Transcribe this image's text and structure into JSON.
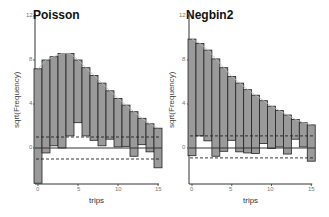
{
  "chart_data": [
    {
      "type": "bar",
      "subtype": "hanging rootogram",
      "title": "Poisson",
      "xlabel": "trips",
      "ylabel": "sqrt(Frequency)",
      "x": [
        0,
        1,
        2,
        3,
        4,
        5,
        6,
        7,
        8,
        9,
        10,
        11,
        12,
        13,
        14,
        15
      ],
      "bar_top": [
        7.2,
        8.0,
        8.3,
        8.6,
        8.6,
        8.0,
        7.3,
        6.6,
        5.9,
        5.2,
        4.5,
        3.9,
        3.3,
        2.7,
        2.2,
        1.8
      ],
      "bar_bottom": [
        -3.2,
        -0.45,
        0.2,
        0.0,
        1.1,
        2.3,
        1.1,
        0.7,
        0.2,
        0.8,
        0.1,
        0.15,
        -0.75,
        0.3,
        -0.35,
        -1.8
      ],
      "reference_lines": {
        "zero": 0,
        "upper_dashed": 1.0,
        "lower_dashed": -1.0
      },
      "xticks": [
        0,
        5,
        10,
        15
      ],
      "yticks": [
        0,
        4,
        8,
        12
      ],
      "xlim": [
        0,
        15
      ],
      "ylim": [
        -3.5,
        12
      ],
      "grid": false
    },
    {
      "type": "bar",
      "subtype": "hanging rootogram",
      "title": "Negbin2",
      "xlabel": "trips",
      "ylabel": "sqrt(Frequency)",
      "x": [
        0,
        1,
        2,
        3,
        4,
        5,
        6,
        7,
        8,
        9,
        10,
        11,
        12,
        13,
        14,
        15
      ],
      "bar_top": [
        9.9,
        9.5,
        8.9,
        8.1,
        7.3,
        6.5,
        5.9,
        5.3,
        4.8,
        4.3,
        3.8,
        3.4,
        3.0,
        2.6,
        2.3,
        2.1
      ],
      "bar_bottom": [
        -0.7,
        1.1,
        0.65,
        -0.75,
        -0.3,
        0.7,
        -0.35,
        -0.45,
        -0.5,
        0.4,
        -0.05,
        0.1,
        -0.55,
        0.8,
        0.1,
        -1.2
      ],
      "reference_lines": {
        "zero": 0,
        "upper_dashed": 1.1,
        "lower_dashed": -0.9
      },
      "xticks": [
        0,
        5,
        10,
        15
      ],
      "yticks": [
        0,
        4,
        8,
        12
      ],
      "xlim": [
        0,
        15
      ],
      "ylim": [
        -3.5,
        12
      ],
      "grid": false
    }
  ],
  "panels": [
    {
      "title": "Poisson",
      "ylabel": "sqrt(Frequency)",
      "xlabel": "trips",
      "yticks": [
        "0",
        "4",
        "8",
        "12"
      ],
      "xticks": [
        "0",
        "5",
        "10",
        "15"
      ]
    },
    {
      "title": "Negbin2",
      "ylabel": "sqrt(Frequency)",
      "xlabel": "trips",
      "yticks": [
        "0",
        "4",
        "8",
        "12"
      ],
      "xticks": [
        "0",
        "5",
        "10",
        "15"
      ]
    }
  ],
  "colors": {
    "bar_fill": "#9a9a9a",
    "bar_stroke": "#222222",
    "axis": "#333333",
    "dash": "#222222"
  }
}
